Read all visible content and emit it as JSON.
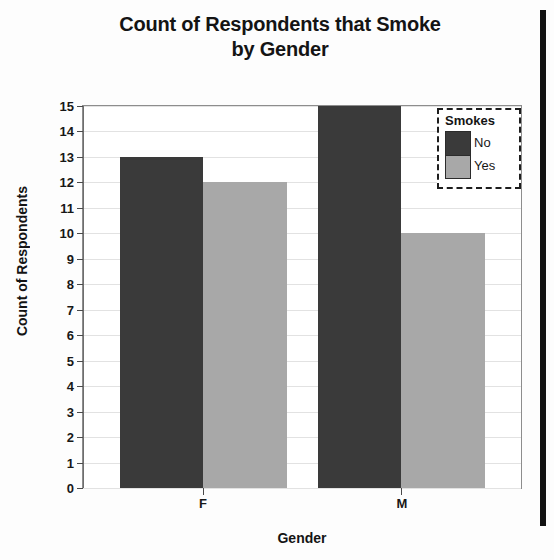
{
  "chart_data": {
    "type": "bar",
    "title": "Count of Respondents that Smoke by Gender",
    "title_line1": "Count of Respondents that Smoke",
    "title_line2": "by Gender",
    "xlabel": "Gender",
    "ylabel": "Count of Respondents",
    "categories": [
      "F",
      "M"
    ],
    "series": [
      {
        "name": "No",
        "values": [
          13,
          15
        ],
        "color": "#3a3a3a"
      },
      {
        "name": "Yes",
        "values": [
          12,
          10
        ],
        "color": "#a8a8a8"
      }
    ],
    "legend_title": "Smokes",
    "legend_position": "top-right",
    "grid": true,
    "ylim": [
      0,
      15
    ],
    "ytick_labels": [
      "15",
      "14",
      "13",
      "12",
      "11",
      "10",
      "9",
      "8",
      "7",
      "6",
      "5",
      "4",
      "3",
      "2",
      "1",
      "0"
    ],
    "ytick_values": [
      15,
      14,
      13,
      12,
      11,
      10,
      9,
      8,
      7,
      6,
      5,
      4,
      3,
      2,
      1,
      0
    ],
    "bar_mode": "grouped"
  },
  "bars": [
    {
      "label": "F-No",
      "category": "F",
      "series": "No",
      "value": 13,
      "color": "#3a3a3a",
      "left_pct": 8.4,
      "width_pct": 19.1
    },
    {
      "label": "F-Yes",
      "category": "F",
      "series": "Yes",
      "value": 12,
      "color": "#a8a8a8",
      "left_pct": 27.5,
      "width_pct": 19.1
    },
    {
      "label": "M-No",
      "category": "M",
      "series": "No",
      "value": 15,
      "color": "#3a3a3a",
      "left_pct": 53.6,
      "width_pct": 19.1
    },
    {
      "label": "M-Yes",
      "category": "M",
      "series": "Yes",
      "value": 10,
      "color": "#a8a8a8",
      "left_pct": 72.7,
      "width_pct": 19.1
    }
  ],
  "xticks": [
    {
      "label": "F",
      "pos_pct": 27.5
    },
    {
      "label": "M",
      "pos_pct": 72.7
    }
  ],
  "legend": {
    "title": "Smokes",
    "entries": [
      {
        "label": "No",
        "color": "#3a3a3a"
      },
      {
        "label": "Yes",
        "color": "#a8a8a8"
      }
    ]
  },
  "colors": {
    "series_no": "#3a3a3a",
    "series_yes": "#a8a8a8",
    "grid": "#e2e2e2",
    "axis": "#8d8d8d",
    "text": "#141414",
    "background": "#ffffff"
  }
}
